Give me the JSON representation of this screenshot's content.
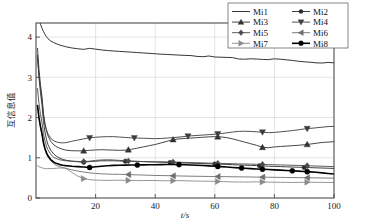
{
  "figure": {
    "background": "#ffffff",
    "width": 371,
    "height": 224
  },
  "axes": {
    "x_title": "t/s",
    "y_title": "互信息值",
    "x_ticks": [
      "20",
      "40",
      "60",
      "80",
      "100"
    ],
    "y_ticks": [
      "0",
      "1",
      "2",
      "3",
      "4"
    ]
  },
  "legend": {
    "entries": [
      {
        "label": "Mi1",
        "marker": "none",
        "color": "#1f1f1f",
        "width": 0.9
      },
      {
        "label": "Mi2",
        "marker": "circle-small",
        "color": "#2b2b2b",
        "width": 0.9
      },
      {
        "label": "Mi3",
        "marker": "triangle-up",
        "color": "#333333",
        "width": 0.9
      },
      {
        "label": "Mi4",
        "marker": "triangle-down",
        "color": "#3d3d3d",
        "width": 0.9
      },
      {
        "label": "Mi5",
        "marker": "diamond",
        "color": "#4a4a4a",
        "width": 0.9
      },
      {
        "label": "Mi6",
        "marker": "triangle-left",
        "color": "#6e6e6e",
        "width": 0.9
      },
      {
        "label": "Mi7",
        "marker": "triangle-right",
        "color": "#8a8a8a",
        "width": 0.9
      },
      {
        "label": "Mi8",
        "marker": "circle",
        "color": "#000000",
        "width": 1.6
      }
    ]
  },
  "chart_data": {
    "type": "line",
    "title": "",
    "xlabel": "t/s",
    "ylabel": "互信息值",
    "xlim": [
      0,
      100
    ],
    "ylim": [
      0,
      4.35
    ],
    "grid": true,
    "legend_position": "top-right",
    "x": [
      0.5,
      1,
      1.5,
      2,
      2.5,
      3,
      3.5,
      4,
      5,
      6,
      7,
      8,
      9,
      10,
      12,
      14,
      16,
      18,
      20,
      22,
      24,
      26,
      28,
      30,
      32,
      34,
      36,
      38,
      40,
      42,
      44,
      46,
      48,
      50,
      52,
      54,
      56,
      58,
      60,
      62,
      64,
      66,
      68,
      70,
      72,
      74,
      76,
      78,
      80,
      82,
      84,
      86,
      88,
      90,
      92,
      94,
      96,
      98,
      100
    ],
    "series": [
      {
        "name": "Mi1",
        "marker": "none",
        "marker_x": [],
        "values": [
          4.6,
          4.45,
          4.32,
          4.22,
          4.14,
          4.07,
          4.01,
          3.96,
          3.9,
          3.86,
          3.83,
          3.8,
          3.78,
          3.76,
          3.73,
          3.71,
          3.695,
          3.72,
          3.7,
          3.68,
          3.665,
          3.655,
          3.645,
          3.635,
          3.625,
          3.615,
          3.605,
          3.595,
          3.585,
          3.575,
          3.568,
          3.56,
          3.552,
          3.545,
          3.54,
          3.52,
          3.512,
          3.53,
          3.505,
          3.5,
          3.495,
          3.49,
          3.455,
          3.45,
          3.46,
          3.455,
          3.445,
          3.44,
          3.46,
          3.45,
          3.435,
          3.42,
          3.4,
          3.385,
          3.375,
          3.36,
          3.355,
          3.37,
          3.36
        ]
      },
      {
        "name": "Mi2",
        "marker": "circle-small",
        "marker_x": [
          16,
          30,
          45,
          60,
          75,
          90
        ],
        "values": [
          3.55,
          3.0,
          2.62,
          2.32,
          1.9,
          1.64,
          1.46,
          1.33,
          1.18,
          1.09,
          1.03,
          0.99,
          0.96,
          0.94,
          0.915,
          0.9,
          0.89,
          0.905,
          0.915,
          0.925,
          0.925,
          0.925,
          0.92,
          0.915,
          0.915,
          0.91,
          0.905,
          0.9,
          0.895,
          0.89,
          0.885,
          0.88,
          0.875,
          0.87,
          0.865,
          0.86,
          0.855,
          0.85,
          0.845,
          0.84,
          0.835,
          0.828,
          0.82,
          0.815,
          0.81,
          0.805,
          0.795,
          0.79,
          0.785,
          0.78,
          0.775,
          0.77,
          0.765,
          0.76,
          0.755,
          0.75,
          0.745,
          0.74,
          0.735
        ]
      },
      {
        "name": "Mi3",
        "marker": "triangle-up",
        "marker_x": [
          16,
          31,
          46,
          61,
          76,
          91
        ],
        "values": [
          3.72,
          3.2,
          2.82,
          2.52,
          2.1,
          1.84,
          1.67,
          1.55,
          1.4,
          1.32,
          1.27,
          1.235,
          1.21,
          1.19,
          1.175,
          1.172,
          1.175,
          1.185,
          1.195,
          1.2,
          1.195,
          1.19,
          1.185,
          1.19,
          1.21,
          1.24,
          1.27,
          1.3,
          1.33,
          1.37,
          1.41,
          1.45,
          1.47,
          1.48,
          1.49,
          1.5,
          1.51,
          1.52,
          1.525,
          1.52,
          1.5,
          1.47,
          1.43,
          1.39,
          1.35,
          1.31,
          1.26,
          1.25,
          1.27,
          1.28,
          1.29,
          1.3,
          1.31,
          1.325,
          1.34,
          1.36,
          1.38,
          1.39,
          1.4
        ]
      },
      {
        "name": "Mi4",
        "marker": "triangle-down",
        "marker_x": [
          18,
          33,
          51,
          61,
          76,
          91
        ],
        "values": [
          3.48,
          3.05,
          2.72,
          2.46,
          2.08,
          1.84,
          1.7,
          1.6,
          1.48,
          1.42,
          1.39,
          1.375,
          1.37,
          1.375,
          1.41,
          1.44,
          1.47,
          1.495,
          1.51,
          1.52,
          1.525,
          1.525,
          1.515,
          1.505,
          1.495,
          1.49,
          1.485,
          1.48,
          1.475,
          1.48,
          1.49,
          1.5,
          1.515,
          1.53,
          1.545,
          1.555,
          1.565,
          1.575,
          1.585,
          1.6,
          1.62,
          1.64,
          1.655,
          1.66,
          1.655,
          1.645,
          1.635,
          1.625,
          1.63,
          1.645,
          1.66,
          1.675,
          1.695,
          1.715,
          1.73,
          1.745,
          1.76,
          1.775,
          1.78
        ]
      },
      {
        "name": "Mi5",
        "marker": "diamond",
        "marker_x": [
          16,
          31,
          46,
          61,
          76,
          91
        ],
        "values": [
          2.72,
          2.35,
          2.08,
          1.88,
          1.6,
          1.42,
          1.29,
          1.2,
          1.08,
          1.01,
          0.975,
          0.95,
          0.935,
          0.925,
          0.915,
          0.91,
          0.905,
          0.915,
          0.935,
          0.945,
          0.95,
          0.945,
          0.935,
          0.925,
          0.915,
          0.91,
          0.905,
          0.9,
          0.9,
          0.898,
          0.896,
          0.894,
          0.89,
          0.885,
          0.88,
          0.876,
          0.872,
          0.868,
          0.864,
          0.86,
          0.856,
          0.852,
          0.848,
          0.845,
          0.842,
          0.838,
          0.835,
          0.83,
          0.826,
          0.822,
          0.818,
          0.814,
          0.81,
          0.806,
          0.8,
          0.795,
          0.79,
          0.785,
          0.78
        ]
      },
      {
        "name": "Mi6",
        "marker": "triangle-left",
        "marker_x": [
          31,
          46,
          61,
          76,
          91
        ],
        "values": [
          2.3,
          1.98,
          1.75,
          1.58,
          1.35,
          1.2,
          1.1,
          1.02,
          0.92,
          0.85,
          0.805,
          0.775,
          0.755,
          0.74,
          0.7,
          0.67,
          0.645,
          0.625,
          0.61,
          0.6,
          0.595,
          0.59,
          0.588,
          0.586,
          0.58,
          0.575,
          0.57,
          0.565,
          0.56,
          0.558,
          0.556,
          0.552,
          0.548,
          0.545,
          0.542,
          0.54,
          0.538,
          0.536,
          0.534,
          0.532,
          0.53,
          0.528,
          0.526,
          0.524,
          0.522,
          0.52,
          0.518,
          0.516,
          0.514,
          0.512,
          0.51,
          0.508,
          0.506,
          0.504,
          0.502,
          0.5,
          0.498,
          0.496,
          0.494
        ]
      },
      {
        "name": "Mi7",
        "marker": "triangle-right",
        "marker_x": [
          16,
          31,
          46,
          61,
          76,
          91
        ],
        "values": [
          0.8,
          0.78,
          0.76,
          0.75,
          0.74,
          0.73,
          0.73,
          0.73,
          0.73,
          0.735,
          0.74,
          0.745,
          0.745,
          0.735,
          0.64,
          0.545,
          0.48,
          0.455,
          0.445,
          0.44,
          0.438,
          0.44,
          0.442,
          0.438,
          0.435,
          0.432,
          0.434,
          0.436,
          0.434,
          0.43,
          0.428,
          0.43,
          0.432,
          0.428,
          0.424,
          0.42,
          0.418,
          0.416,
          0.412,
          0.408,
          0.405,
          0.4,
          0.398,
          0.396,
          0.398,
          0.4,
          0.398,
          0.395,
          0.392,
          0.39,
          0.388,
          0.386,
          0.388,
          0.39,
          0.392,
          0.39,
          0.388,
          0.386,
          0.384
        ]
      },
      {
        "name": "Mi8",
        "marker": "circle",
        "marker_x": [
          18,
          34,
          48,
          61,
          69,
          76,
          86,
          91
        ],
        "values": [
          2.3,
          2.0,
          1.78,
          1.6,
          1.38,
          1.23,
          1.13,
          1.05,
          0.95,
          0.89,
          0.855,
          0.83,
          0.815,
          0.805,
          0.79,
          0.78,
          0.77,
          0.76,
          0.775,
          0.79,
          0.8,
          0.81,
          0.815,
          0.818,
          0.82,
          0.822,
          0.824,
          0.826,
          0.828,
          0.83,
          0.832,
          0.834,
          0.83,
          0.826,
          0.82,
          0.814,
          0.806,
          0.798,
          0.79,
          0.78,
          0.77,
          0.76,
          0.75,
          0.74,
          0.73,
          0.722,
          0.715,
          0.708,
          0.7,
          0.692,
          0.684,
          0.676,
          0.668,
          0.66,
          0.65,
          0.64,
          0.625,
          0.61,
          0.595
        ]
      }
    ]
  }
}
